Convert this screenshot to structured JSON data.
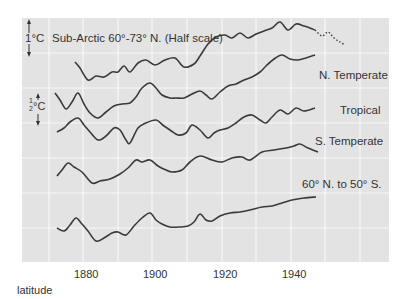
{
  "chart_data": {
    "type": "line",
    "title": "",
    "xlabel": "latitude",
    "ylabel": "",
    "x_ticks": [
      "1880",
      "1900",
      "1920",
      "1940"
    ],
    "xlim": [
      1870,
      1960
    ],
    "grid": true,
    "scale_markers": [
      {
        "label": "1°C",
        "applies_to": "Sub-Arctic"
      },
      {
        "label": "½°C",
        "applies_to": "other series"
      }
    ],
    "series": [
      {
        "name": "Sub-Arctic 60°-73° N. (Half scale)",
        "points_px": [
          [
            75,
            62
          ],
          [
            80,
            68
          ],
          [
            88,
            80
          ],
          [
            96,
            76
          ],
          [
            104,
            77
          ],
          [
            112,
            72
          ],
          [
            118,
            72
          ],
          [
            124,
            66
          ],
          [
            130,
            72
          ],
          [
            138,
            63
          ],
          [
            146,
            60
          ],
          [
            155,
            65
          ],
          [
            165,
            60
          ],
          [
            175,
            58
          ],
          [
            184,
            67
          ],
          [
            194,
            64
          ],
          [
            200,
            56
          ],
          [
            208,
            44
          ],
          [
            216,
            37
          ],
          [
            225,
            35
          ],
          [
            232,
            38
          ],
          [
            240,
            33
          ],
          [
            248,
            38
          ],
          [
            256,
            34
          ],
          [
            264,
            31
          ],
          [
            272,
            28
          ],
          [
            280,
            22
          ],
          [
            288,
            30
          ],
          [
            296,
            24
          ],
          [
            304,
            26
          ],
          [
            310,
            28
          ],
          [
            315,
            30
          ]
        ],
        "extension_dotted_px": [
          [
            315,
            30
          ],
          [
            322,
            36
          ],
          [
            328,
            32
          ],
          [
            334,
            38
          ],
          [
            340,
            42
          ],
          [
            345,
            45
          ]
        ]
      },
      {
        "name": "N. Temperate",
        "points_px": [
          [
            55,
            93
          ],
          [
            60,
            100
          ],
          [
            66,
            109
          ],
          [
            72,
            102
          ],
          [
            78,
            93
          ],
          [
            84,
            104
          ],
          [
            90,
            113
          ],
          [
            98,
            118
          ],
          [
            106,
            112
          ],
          [
            114,
            106
          ],
          [
            122,
            104
          ],
          [
            130,
            103
          ],
          [
            136,
            97
          ],
          [
            142,
            88
          ],
          [
            150,
            83
          ],
          [
            156,
            88
          ],
          [
            162,
            95
          ],
          [
            170,
            98
          ],
          [
            176,
            98
          ],
          [
            184,
            98
          ],
          [
            192,
            94
          ],
          [
            200,
            91
          ],
          [
            206,
            95
          ],
          [
            212,
            99
          ],
          [
            220,
            92
          ],
          [
            228,
            86
          ],
          [
            236,
            84
          ],
          [
            244,
            80
          ],
          [
            252,
            77
          ],
          [
            260,
            72
          ],
          [
            266,
            66
          ],
          [
            274,
            59
          ],
          [
            282,
            55
          ],
          [
            290,
            59
          ],
          [
            298,
            60
          ],
          [
            306,
            58
          ],
          [
            315,
            55
          ]
        ]
      },
      {
        "name": "Tropical",
        "points_px": [
          [
            57,
            132
          ],
          [
            64,
            128
          ],
          [
            70,
            122
          ],
          [
            78,
            118
          ],
          [
            84,
            125
          ],
          [
            90,
            132
          ],
          [
            98,
            140
          ],
          [
            106,
            136
          ],
          [
            114,
            128
          ],
          [
            120,
            130
          ],
          [
            126,
            140
          ],
          [
            130,
            143
          ],
          [
            138,
            128
          ],
          [
            146,
            123
          ],
          [
            156,
            120
          ],
          [
            164,
            126
          ],
          [
            170,
            130
          ],
          [
            178,
            135
          ],
          [
            186,
            133
          ],
          [
            192,
            125
          ],
          [
            200,
            130
          ],
          [
            208,
            138
          ],
          [
            214,
            133
          ],
          [
            220,
            130
          ],
          [
            228,
            128
          ],
          [
            236,
            123
          ],
          [
            244,
            117
          ],
          [
            252,
            115
          ],
          [
            260,
            120
          ],
          [
            266,
            123
          ],
          [
            272,
            117
          ],
          [
            280,
            110
          ],
          [
            288,
            114
          ],
          [
            296,
            108
          ],
          [
            304,
            111
          ],
          [
            315,
            108
          ]
        ]
      },
      {
        "name": "S. Temperate",
        "points_px": [
          [
            57,
            176
          ],
          [
            62,
            170
          ],
          [
            68,
            163
          ],
          [
            74,
            167
          ],
          [
            82,
            172
          ],
          [
            92,
            183
          ],
          [
            100,
            181
          ],
          [
            110,
            179
          ],
          [
            120,
            174
          ],
          [
            128,
            168
          ],
          [
            136,
            160
          ],
          [
            142,
            162
          ],
          [
            150,
            160
          ],
          [
            158,
            166
          ],
          [
            166,
            170
          ],
          [
            172,
            172
          ],
          [
            182,
            170
          ],
          [
            190,
            162
          ],
          [
            200,
            156
          ],
          [
            212,
            160
          ],
          [
            222,
            162
          ],
          [
            232,
            158
          ],
          [
            242,
            157
          ],
          [
            250,
            160
          ],
          [
            262,
            152
          ],
          [
            274,
            150
          ],
          [
            286,
            148
          ],
          [
            294,
            146
          ],
          [
            300,
            144
          ],
          [
            308,
            148
          ],
          [
            318,
            152
          ]
        ]
      },
      {
        "name": "60° N. to 50° S.",
        "points_px": [
          [
            57,
            228
          ],
          [
            64,
            231
          ],
          [
            70,
            225
          ],
          [
            76,
            218
          ],
          [
            82,
            224
          ],
          [
            88,
            231
          ],
          [
            96,
            241
          ],
          [
            104,
            238
          ],
          [
            112,
            233
          ],
          [
            118,
            232
          ],
          [
            126,
            235
          ],
          [
            134,
            226
          ],
          [
            142,
            218
          ],
          [
            150,
            213
          ],
          [
            156,
            220
          ],
          [
            162,
            224
          ],
          [
            170,
            227
          ],
          [
            180,
            227
          ],
          [
            188,
            226
          ],
          [
            194,
            222
          ],
          [
            200,
            214
          ],
          [
            206,
            220
          ],
          [
            212,
            221
          ],
          [
            220,
            216
          ],
          [
            230,
            213
          ],
          [
            240,
            212
          ],
          [
            250,
            210
          ],
          [
            262,
            207
          ],
          [
            272,
            206
          ],
          [
            282,
            203
          ],
          [
            292,
            200
          ],
          [
            304,
            198
          ],
          [
            316,
            197
          ]
        ]
      }
    ],
    "labels": [
      {
        "text": "1°C Sub-Arctic 60°-73° N. (Half scale)"
      },
      {
        "text": "N. Temperate"
      },
      {
        "text": "Tropical"
      },
      {
        "text": "S. Temperate"
      },
      {
        "text": "60° N. to 50° S."
      }
    ]
  },
  "labels": {
    "subarctic_scale": "1°C",
    "subarctic": "Sub-Arctic 60°-73° N. (Half scale)",
    "n_temperate": "N. Temperate",
    "tropical": "Tropical",
    "s_temperate": "S. Temperate",
    "global": "60° N. to 50° S.",
    "half_scale_num": "1",
    "half_scale_den": "2",
    "half_scale_unit": "°C",
    "x_axis": "latitude"
  },
  "x_ticks": [
    "1880",
    "1900",
    "1920",
    "1940"
  ],
  "colors": {
    "plot_bg": "#e3e3e3",
    "grid": "#f7f7f7",
    "line": "#3a3a3a"
  }
}
